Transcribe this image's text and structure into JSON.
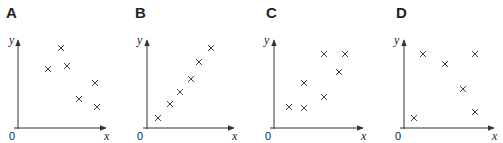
{
  "chart_data": [
    {
      "type": "scatter",
      "title": "A",
      "xlabel": "x",
      "ylabel": "y",
      "origin_label": "0",
      "grid": false,
      "description": "Negative correlation",
      "points": [
        [
          48,
          69
        ],
        [
          61,
          48
        ],
        [
          67,
          66
        ],
        [
          79,
          99
        ],
        [
          95,
          83
        ],
        [
          97,
          107
        ]
      ]
    },
    {
      "type": "scatter",
      "title": "B",
      "xlabel": "x",
      "ylabel": "y",
      "origin_label": "0",
      "grid": false,
      "description": "Strong positive correlation",
      "points": [
        [
          158,
          118
        ],
        [
          170,
          104
        ],
        [
          180,
          92
        ],
        [
          191,
          79
        ],
        [
          199,
          62
        ],
        [
          211,
          48
        ]
      ]
    },
    {
      "type": "scatter",
      "title": "C",
      "xlabel": "x",
      "ylabel": "y",
      "origin_label": "0",
      "grid": false,
      "description": "Positive correlation",
      "points": [
        [
          289,
          107
        ],
        [
          304,
          108
        ],
        [
          304,
          83
        ],
        [
          324,
          97
        ],
        [
          324,
          54
        ],
        [
          339,
          72
        ],
        [
          345,
          54
        ]
      ]
    },
    {
      "type": "scatter",
      "title": "D",
      "xlabel": "x",
      "ylabel": "y",
      "origin_label": "0",
      "grid": false,
      "description": "No correlation",
      "points": [
        [
          414,
          118
        ],
        [
          423,
          54
        ],
        [
          445,
          64
        ],
        [
          463,
          89
        ],
        [
          475,
          54
        ],
        [
          475,
          112
        ]
      ]
    }
  ],
  "panels": [
    {
      "label": "A",
      "x_axis_label": "x",
      "y_axis_label": "y",
      "origin": "0"
    },
    {
      "label": "B",
      "x_axis_label": "x",
      "y_axis_label": "y",
      "origin": "0"
    },
    {
      "label": "C",
      "x_axis_label": "x",
      "y_axis_label": "y",
      "origin": "0"
    },
    {
      "label": "D",
      "x_axis_label": "x",
      "y_axis_label": "y",
      "origin": "0"
    }
  ],
  "style": {
    "axis_color": "#333333",
    "marker_color": "#444444"
  }
}
